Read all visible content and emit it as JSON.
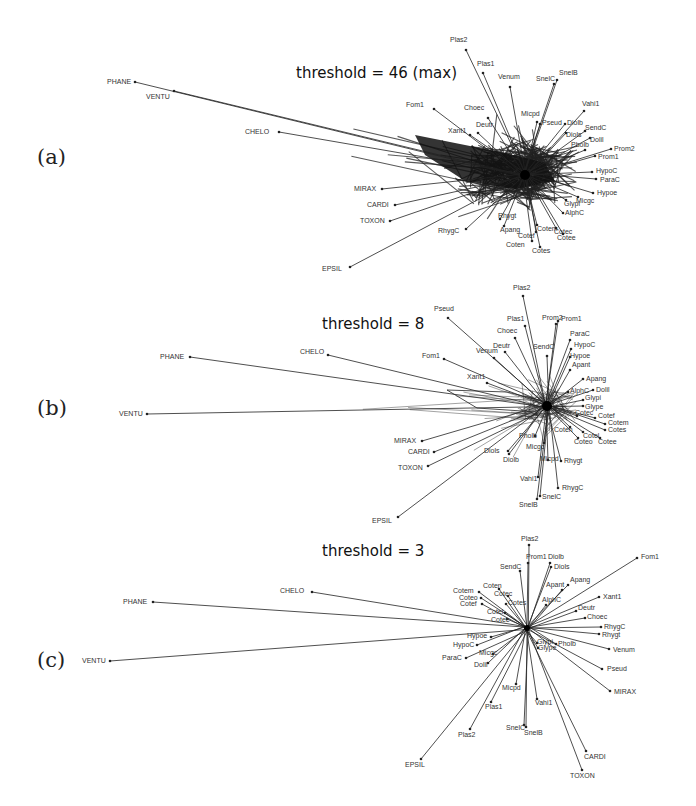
{
  "figure": {
    "panels": [
      {
        "id": "a",
        "label": "(a)",
        "title": "threshold = 46 (max)",
        "hub": [
          525,
          175
        ],
        "density": "heavy",
        "nodes": [
          {
            "name": "PHANE",
            "x": 135,
            "y": 82,
            "lx": -28,
            "ly": 2
          },
          {
            "name": "VENTU",
            "x": 174,
            "y": 91,
            "lx": -28,
            "ly": 8
          },
          {
            "name": "CHELO",
            "x": 279,
            "y": 132,
            "lx": -34,
            "ly": 2
          },
          {
            "name": "MIRAX",
            "x": 382,
            "y": 189,
            "lx": -28,
            "ly": 2
          },
          {
            "name": "CARDI",
            "x": 395,
            "y": 205,
            "lx": -28,
            "ly": 2
          },
          {
            "name": "TOXON",
            "x": 390,
            "y": 221,
            "lx": -30,
            "ly": 2
          },
          {
            "name": "EPSIL",
            "x": 350,
            "y": 267,
            "lx": -28,
            "ly": 4
          },
          {
            "name": "Plas2",
            "x": 466,
            "y": 50,
            "lx": -16,
            "ly": -8
          },
          {
            "name": "Plas1",
            "x": 483,
            "y": 73,
            "lx": -6,
            "ly": -7
          },
          {
            "name": "Venum",
            "x": 510,
            "y": 87,
            "lx": -12,
            "ly": -8
          },
          {
            "name": "SnelC",
            "x": 554,
            "y": 84,
            "lx": -18,
            "ly": -3
          },
          {
            "name": "SnelB",
            "x": 557,
            "y": 80,
            "lx": 2,
            "ly": -5
          },
          {
            "name": "Fom1",
            "x": 434,
            "y": 109,
            "lx": -28,
            "ly": -2
          },
          {
            "name": "Choec",
            "x": 488,
            "y": 118,
            "lx": -24,
            "ly": -8
          },
          {
            "name": "Xant1",
            "x": 470,
            "y": 135,
            "lx": -22,
            "ly": -2
          },
          {
            "name": "Deutr",
            "x": 478,
            "y": 133,
            "lx": -2,
            "ly": -6
          },
          {
            "name": "Micpd",
            "x": 537,
            "y": 122,
            "lx": -16,
            "ly": -6
          },
          {
            "name": "Vahi1",
            "x": 584,
            "y": 111,
            "lx": -2,
            "ly": -5
          },
          {
            "name": "Pseud",
            "x": 540,
            "y": 124,
            "lx": 2,
            "ly": 1
          },
          {
            "name": "Diolb",
            "x": 565,
            "y": 124,
            "lx": 2,
            "ly": 1
          },
          {
            "name": "Diols",
            "x": 566,
            "y": 133,
            "lx": 0,
            "ly": 4
          },
          {
            "name": "SendC",
            "x": 585,
            "y": 131,
            "lx": 0,
            "ly": -1
          },
          {
            "name": "Dolil",
            "x": 590,
            "y": 138,
            "lx": 0,
            "ly": 4
          },
          {
            "name": "Pholb",
            "x": 585,
            "y": 150,
            "lx": -14,
            "ly": -3
          },
          {
            "name": "Prom2",
            "x": 611,
            "y": 149,
            "lx": 3,
            "ly": 2
          },
          {
            "name": "Prom1",
            "x": 595,
            "y": 156,
            "lx": 3,
            "ly": 3
          },
          {
            "name": "HypoC",
            "x": 592,
            "y": 172,
            "lx": 4,
            "ly": 1
          },
          {
            "name": "ParaC",
            "x": 596,
            "y": 179,
            "lx": 4,
            "ly": 3
          },
          {
            "name": "Hypoe",
            "x": 593,
            "y": 193,
            "lx": 4,
            "ly": 2
          },
          {
            "name": "Micgc",
            "x": 578,
            "y": 197,
            "lx": -2,
            "ly": 6
          },
          {
            "name": "Glypi",
            "x": 566,
            "y": 200,
            "lx": -2,
            "ly": 6
          },
          {
            "name": "AlphC",
            "x": 563,
            "y": 213,
            "lx": 2,
            "ly": 2
          },
          {
            "name": "RhygC",
            "x": 466,
            "y": 229,
            "lx": -28,
            "ly": 4
          },
          {
            "name": "Rhygt",
            "x": 500,
            "y": 219,
            "lx": -2,
            "ly": -1
          },
          {
            "name": "Apang",
            "x": 504,
            "y": 226,
            "lx": -4,
            "ly": 6
          },
          {
            "name": "Cotem",
            "x": 537,
            "y": 225,
            "lx": 0,
            "ly": 6
          },
          {
            "name": "Cotec",
            "x": 556,
            "y": 228,
            "lx": -2,
            "ly": 6
          },
          {
            "name": "Cotef",
            "x": 536,
            "y": 232,
            "lx": -18,
            "ly": 6
          },
          {
            "name": "Cotee",
            "x": 563,
            "y": 234,
            "lx": -6,
            "ly": 6
          },
          {
            "name": "Coten",
            "x": 532,
            "y": 241,
            "lx": -26,
            "ly": 6
          },
          {
            "name": "Cotes",
            "x": 540,
            "y": 247,
            "lx": -8,
            "ly": 6
          }
        ]
      },
      {
        "id": "b",
        "label": "(b)",
        "title": "threshold = 8",
        "hub": [
          547,
          406
        ],
        "density": "medium",
        "nodes": [
          {
            "name": "PHANE",
            "x": 190,
            "y": 357,
            "lx": -30,
            "ly": 2
          },
          {
            "name": "VENTU",
            "x": 147,
            "y": 414,
            "lx": -28,
            "ly": 2
          },
          {
            "name": "CHELO",
            "x": 328,
            "y": 355,
            "lx": -28,
            "ly": -1
          },
          {
            "name": "MIRAX",
            "x": 422,
            "y": 441,
            "lx": -28,
            "ly": 2
          },
          {
            "name": "CARDI",
            "x": 434,
            "y": 452,
            "lx": -26,
            "ly": 2
          },
          {
            "name": "TOXON",
            "x": 428,
            "y": 466,
            "lx": -30,
            "ly": 4
          },
          {
            "name": "EPSIL",
            "x": 398,
            "y": 517,
            "lx": -26,
            "ly": 6
          },
          {
            "name": "Pseud",
            "x": 448,
            "y": 318,
            "lx": -14,
            "ly": -7
          },
          {
            "name": "Plas2",
            "x": 523,
            "y": 296,
            "lx": -10,
            "ly": -6
          },
          {
            "name": "Plas1",
            "x": 525,
            "y": 326,
            "lx": -18,
            "ly": -5
          },
          {
            "name": "Prom2",
            "x": 556,
            "y": 324,
            "lx": -14,
            "ly": -4
          },
          {
            "name": "Prom1",
            "x": 558,
            "y": 321,
            "lx": 3,
            "ly": 0
          },
          {
            "name": "Choec",
            "x": 515,
            "y": 338,
            "lx": -18,
            "ly": -5
          },
          {
            "name": "SendC",
            "x": 547,
            "y": 356,
            "lx": -14,
            "ly": -7
          },
          {
            "name": "ParaC",
            "x": 570,
            "y": 340,
            "lx": 0,
            "ly": -4
          },
          {
            "name": "HypoC",
            "x": 571,
            "y": 349,
            "lx": 3,
            "ly": -2
          },
          {
            "name": "Hypoe",
            "x": 570,
            "y": 357,
            "lx": 0,
            "ly": 1
          },
          {
            "name": "Deutr",
            "x": 505,
            "y": 352,
            "lx": -12,
            "ly": -4
          },
          {
            "name": "Venum",
            "x": 494,
            "y": 358,
            "lx": -18,
            "ly": -5
          },
          {
            "name": "Fom1",
            "x": 444,
            "y": 359,
            "lx": -22,
            "ly": -1
          },
          {
            "name": "Xant1",
            "x": 487,
            "y": 383,
            "lx": -20,
            "ly": -4
          },
          {
            "name": "Apant",
            "x": 570,
            "y": 370,
            "lx": 2,
            "ly": -3
          },
          {
            "name": "Apang",
            "x": 583,
            "y": 379,
            "lx": 3,
            "ly": 2
          },
          {
            "name": "AlphC",
            "x": 568,
            "y": 392,
            "lx": 2,
            "ly": 1
          },
          {
            "name": "Dolil",
            "x": 593,
            "y": 390,
            "lx": 3,
            "ly": 2
          },
          {
            "name": "Glypi",
            "x": 583,
            "y": 400,
            "lx": 2,
            "ly": 0
          },
          {
            "name": "Glype",
            "x": 583,
            "y": 406,
            "lx": 2,
            "ly": 3
          },
          {
            "name": "Cotec",
            "x": 577,
            "y": 416,
            "lx": -2,
            "ly": -1
          },
          {
            "name": "Cotef",
            "x": 595,
            "y": 418,
            "lx": 3,
            "ly": 0
          },
          {
            "name": "Cotem",
            "x": 605,
            "y": 424,
            "lx": 3,
            "ly": 1
          },
          {
            "name": "Cotes",
            "x": 605,
            "y": 430,
            "lx": 3,
            "ly": 2
          },
          {
            "name": "Coten",
            "x": 570,
            "y": 427,
            "lx": -16,
            "ly": 5
          },
          {
            "name": "Cotel",
            "x": 583,
            "y": 432,
            "lx": 0,
            "ly": 6
          },
          {
            "name": "Coteo",
            "x": 578,
            "y": 438,
            "lx": -4,
            "ly": 6
          },
          {
            "name": "Cotee",
            "x": 600,
            "y": 438,
            "lx": -2,
            "ly": 6
          },
          {
            "name": "Pholb",
            "x": 535,
            "y": 436,
            "lx": -16,
            "ly": 2
          },
          {
            "name": "Micgc",
            "x": 544,
            "y": 443,
            "lx": -18,
            "ly": 6
          },
          {
            "name": "Diols",
            "x": 508,
            "y": 451,
            "lx": -24,
            "ly": 2
          },
          {
            "name": "Diolb",
            "x": 509,
            "y": 454,
            "lx": -6,
            "ly": 8
          },
          {
            "name": "Micpd",
            "x": 548,
            "y": 460,
            "lx": -8,
            "ly": 1
          },
          {
            "name": "Rhygt",
            "x": 561,
            "y": 461,
            "lx": 3,
            "ly": 2
          },
          {
            "name": "Vahi1",
            "x": 538,
            "y": 477,
            "lx": -18,
            "ly": 4
          },
          {
            "name": "RhygC",
            "x": 558,
            "y": 488,
            "lx": 4,
            "ly": 2
          },
          {
            "name": "SnelC",
            "x": 540,
            "y": 496,
            "lx": 2,
            "ly": 3
          },
          {
            "name": "SnelB",
            "x": 537,
            "y": 499,
            "lx": -18,
            "ly": 8
          }
        ]
      },
      {
        "id": "c",
        "label": "(c)",
        "title": "threshold = 3",
        "hub": [
          527,
          628
        ],
        "density": "light",
        "nodes": [
          {
            "name": "PHANE",
            "x": 153,
            "y": 602,
            "lx": -30,
            "ly": 2
          },
          {
            "name": "VENTU",
            "x": 110,
            "y": 661,
            "lx": -28,
            "ly": 2
          },
          {
            "name": "CHELO",
            "x": 312,
            "y": 592,
            "lx": -32,
            "ly": 1
          },
          {
            "name": "Plas2",
            "x": 529,
            "y": 545,
            "lx": -8,
            "ly": -4
          },
          {
            "name": "Prom1",
            "x": 528,
            "y": 563,
            "lx": -2,
            "ly": -4
          },
          {
            "name": "SendC",
            "x": 520,
            "y": 571,
            "lx": -20,
            "ly": -2
          },
          {
            "name": "Diolb",
            "x": 550,
            "y": 563,
            "lx": -2,
            "ly": -4
          },
          {
            "name": "Diols",
            "x": 551,
            "y": 567,
            "lx": 3,
            "ly": 2
          },
          {
            "name": "Fom1",
            "x": 637,
            "y": 558,
            "lx": 4,
            "ly": 1
          },
          {
            "name": "Apang",
            "x": 568,
            "y": 585,
            "lx": 2,
            "ly": -3
          },
          {
            "name": "Apant",
            "x": 562,
            "y": 590,
            "lx": -16,
            "ly": -3
          },
          {
            "name": "Xant1",
            "x": 599,
            "y": 597,
            "lx": 4,
            "ly": 2
          },
          {
            "name": "AlphC",
            "x": 546,
            "y": 605,
            "lx": -4,
            "ly": -3
          },
          {
            "name": "Coten",
            "x": 499,
            "y": 589,
            "lx": -16,
            "ly": -1
          },
          {
            "name": "Cotem",
            "x": 479,
            "y": 592,
            "lx": -26,
            "ly": 1
          },
          {
            "name": "Cotec",
            "x": 508,
            "y": 596,
            "lx": -14,
            "ly": 0
          },
          {
            "name": "Coteo",
            "x": 481,
            "y": 598,
            "lx": -22,
            "ly": 2
          },
          {
            "name": "Cotef",
            "x": 482,
            "y": 604,
            "lx": -22,
            "ly": 2
          },
          {
            "name": "Cotes",
            "x": 506,
            "y": 604,
            "lx": 2,
            "ly": 1
          },
          {
            "name": "Cotel",
            "x": 505,
            "y": 613,
            "lx": -18,
            "ly": 1
          },
          {
            "name": "Cotee",
            "x": 507,
            "y": 619,
            "lx": -16,
            "ly": 3
          },
          {
            "name": "Deutr",
            "x": 576,
            "y": 611,
            "lx": 2,
            "ly": -1
          },
          {
            "name": "Choec",
            "x": 585,
            "y": 618,
            "lx": 2,
            "ly": 1
          },
          {
            "name": "RhygC",
            "x": 601,
            "y": 627,
            "lx": 3,
            "ly": 2
          },
          {
            "name": "Rhygt",
            "x": 599,
            "y": 634,
            "lx": 3,
            "ly": 3
          },
          {
            "name": "Hypoe",
            "x": 491,
            "y": 637,
            "lx": -24,
            "ly": 1
          },
          {
            "name": "HypoC",
            "x": 477,
            "y": 645,
            "lx": -24,
            "ly": 2
          },
          {
            "name": "ParaC",
            "x": 466,
            "y": 658,
            "lx": -24,
            "ly": 2
          },
          {
            "name": "Micgc",
            "x": 493,
            "y": 654,
            "lx": -14,
            "ly": 1
          },
          {
            "name": "Dolil",
            "x": 488,
            "y": 663,
            "lx": -14,
            "ly": 4
          },
          {
            "name": "Glypi",
            "x": 537,
            "y": 643,
            "lx": 0,
            "ly": 1
          },
          {
            "name": "Glype",
            "x": 538,
            "y": 648,
            "lx": 0,
            "ly": 2
          },
          {
            "name": "Pholb",
            "x": 556,
            "y": 644,
            "lx": 2,
            "ly": 2
          },
          {
            "name": "Venum",
            "x": 609,
            "y": 649,
            "lx": 4,
            "ly": 3
          },
          {
            "name": "Pseud",
            "x": 602,
            "y": 669,
            "lx": 5,
            "ly": 2
          },
          {
            "name": "MIRAX",
            "x": 610,
            "y": 691,
            "lx": 4,
            "ly": 3
          },
          {
            "name": "Micpd",
            "x": 516,
            "y": 684,
            "lx": -14,
            "ly": 6
          },
          {
            "name": "Vahi1",
            "x": 537,
            "y": 699,
            "lx": -2,
            "ly": 6
          },
          {
            "name": "Plas1",
            "x": 491,
            "y": 702,
            "lx": -6,
            "ly": 7
          },
          {
            "name": "SnelC",
            "x": 524,
            "y": 725,
            "lx": -18,
            "ly": 5
          },
          {
            "name": "SnelB",
            "x": 526,
            "y": 727,
            "lx": -2,
            "ly": 8
          },
          {
            "name": "Plas2b",
            "x": 470,
            "y": 729,
            "lx": -12,
            "ly": 8,
            "display": "Plas2"
          },
          {
            "name": "EPSIL",
            "x": 421,
            "y": 759,
            "lx": -16,
            "ly": 8
          },
          {
            "name": "CARDI",
            "x": 586,
            "y": 751,
            "lx": -2,
            "ly": 8
          },
          {
            "name": "TOXON",
            "x": 582,
            "y": 770,
            "lx": -12,
            "ly": 8
          }
        ]
      }
    ],
    "line_color": "#222222",
    "background": "#ffffff"
  }
}
